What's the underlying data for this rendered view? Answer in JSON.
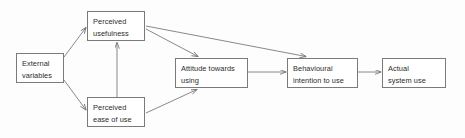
{
  "diagram": {
    "background_color": "#fdfdfd",
    "box_border_color": "#7a7a7a",
    "edge_color": "#6b6b6b",
    "text_color": "#2b2b2b",
    "nodes": [
      {
        "id": "external",
        "line1": "External",
        "line2": "variables"
      },
      {
        "id": "usefulness",
        "line1": "Perceived",
        "line2": "usefulness"
      },
      {
        "id": "easeofuse",
        "line1": "Perceived",
        "line2": "ease of use"
      },
      {
        "id": "attitude",
        "line1": "Attitude towards",
        "line2": "using"
      },
      {
        "id": "intention",
        "line1": "Behavioural",
        "line2": "intention to use"
      },
      {
        "id": "actualuse",
        "line1": "Actual",
        "line2": "system use"
      }
    ],
    "edges": [
      {
        "id": "external-to-usefulness",
        "from": "external",
        "to": "usefulness"
      },
      {
        "id": "external-to-easeofuse",
        "from": "external",
        "to": "easeofuse"
      },
      {
        "id": "easeofuse-to-usefulness",
        "from": "easeofuse",
        "to": "usefulness"
      },
      {
        "id": "usefulness-to-attitude",
        "from": "usefulness",
        "to": "attitude"
      },
      {
        "id": "usefulness-to-intention",
        "from": "usefulness",
        "to": "intention"
      },
      {
        "id": "easeofuse-to-attitude",
        "from": "easeofuse",
        "to": "attitude"
      },
      {
        "id": "attitude-to-intention",
        "from": "attitude",
        "to": "intention"
      },
      {
        "id": "intention-to-actualuse",
        "from": "intention",
        "to": "actualuse"
      }
    ]
  }
}
